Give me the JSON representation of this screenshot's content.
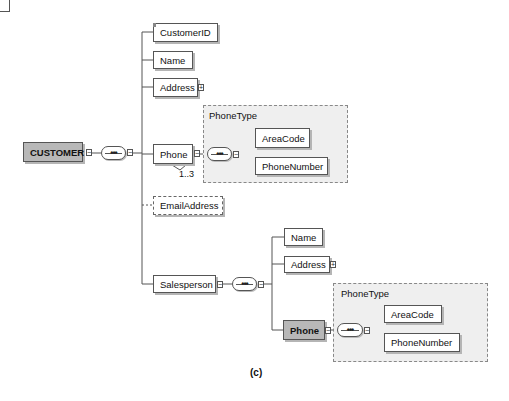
{
  "diagram": {
    "root": {
      "label": "CUSTOMER",
      "toggle": "−"
    },
    "compositor_symbol": "•••",
    "children": [
      {
        "label": "CustomerID",
        "toggle": ""
      },
      {
        "label": "Name",
        "toggle": ""
      },
      {
        "label": "Address",
        "toggle": "+"
      },
      {
        "label": "Phone",
        "toggle": "−",
        "multiplicity": "1..3"
      },
      {
        "label": "EmailAddress",
        "toggle": "",
        "optional": true
      },
      {
        "label": "Salesperson",
        "toggle": "−"
      }
    ],
    "phone_type": {
      "label": "PhoneType",
      "children": [
        {
          "label": "AreaCode"
        },
        {
          "label": "PhoneNumber"
        }
      ]
    },
    "salesperson": {
      "children": [
        {
          "label": "Name",
          "toggle": ""
        },
        {
          "label": "Address",
          "toggle": "+"
        },
        {
          "label": "Phone",
          "toggle": "−"
        }
      ],
      "phone_type": {
        "label": "PhoneType",
        "children": [
          {
            "label": "AreaCode"
          },
          {
            "label": "PhoneNumber"
          }
        ]
      }
    },
    "caption": "(c)",
    "colors": {
      "highlight_fill": "#b8b8b8",
      "group_fill": "#efefef",
      "border": "#555555"
    }
  }
}
